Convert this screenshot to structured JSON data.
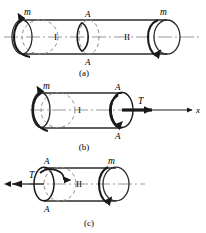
{
  "figure": {
    "type": "engineering-diagram",
    "panels": [
      {
        "key": "a",
        "caption": "(a)",
        "description": "Full shaft with external torques m at both ends, sections I and II divided by cut A-A",
        "labels": {
          "left_torque": "m",
          "right_torque": "m",
          "segment_left": "I",
          "segment_right": "II",
          "section_top": "A",
          "section_bottom": "A"
        }
      },
      {
        "key": "b",
        "caption": "(b)",
        "description": "Left free body of segment I with external torque m and internal torque T at cut A-A, axis x to the right",
        "labels": {
          "left_torque": "m",
          "internal_torque": "T",
          "segment": "I",
          "section_top": "A",
          "section_bottom": "A",
          "axis": "x"
        }
      },
      {
        "key": "c",
        "caption": "(c)",
        "description": "Right free body of segment II with internal torque T at cut A-A pointing left and external torque m at right end",
        "labels": {
          "internal_torque": "T",
          "right_torque": "m",
          "segment": "II",
          "section_top": "A",
          "section_bottom": "A"
        }
      }
    ]
  },
  "colors": {
    "ink": "#1a1a1a",
    "outline": "#2b2b2b",
    "hidden_edge": "#8a8a8a",
    "centerline": "#9a9a9a",
    "background": "#ffffff"
  }
}
